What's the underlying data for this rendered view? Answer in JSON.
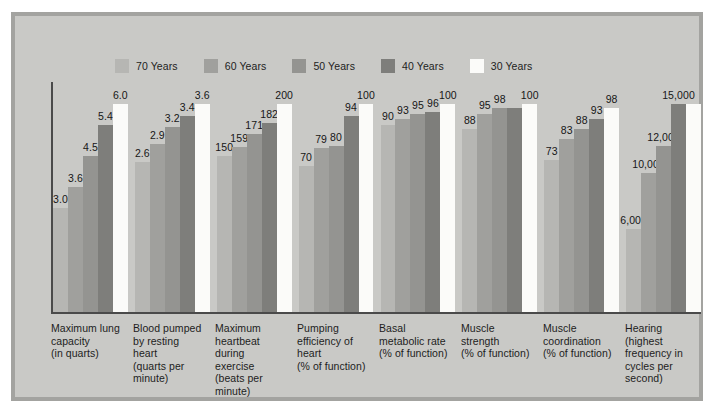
{
  "figure": {
    "background_color": "#c9c9c6",
    "frame_border_color": "#a3a3a0"
  },
  "legend": {
    "position": "top-center",
    "items": [
      {
        "label": "70 Years",
        "color": "#b6b6b3"
      },
      {
        "label": "60 Years",
        "color": "#a0a09d"
      },
      {
        "label": "50 Years",
        "color": "#949491"
      },
      {
        "label": "40 Years",
        "color": "#7e7e7b"
      },
      {
        "label": "30 Years",
        "color": "#fbfbf9"
      }
    ]
  },
  "chart_data": {
    "type": "bar",
    "title": "",
    "subtitle": "",
    "xlabel": "",
    "ylabel": "",
    "grid": false,
    "legend_position": "top-center",
    "note": "Grouped bar chart; each group is normalized to its own scale with the 30 Years bar at 100%.",
    "categories": [
      "Maximum lung capacity (in quarts)",
      "Blood pumped by resting heart (quarts per minute)",
      "Maximum heartbeat during exercise (beats per minute)",
      "Pumping efficiency of heart (% of function)",
      "Basal metabolic rate (% of function)",
      "Muscle strength (% of function)",
      "Muscle coordination (% of function)",
      "Hearing (highest frequency in cycles per second)"
    ],
    "category_lines": [
      [
        "Maximum lung",
        "capacity",
        "(in quarts)"
      ],
      [
        "Blood pumped",
        "by resting",
        "heart",
        "(quarts per",
        "minute)"
      ],
      [
        "Maximum",
        "heartbeat",
        "during",
        "exercise",
        "(beats per",
        "minute)"
      ],
      [
        "Pumping",
        "efficiency of",
        "heart",
        "(% of function)"
      ],
      [
        "Basal",
        "metabolic rate",
        "(% of function)"
      ],
      [
        "Muscle",
        "strength",
        "(% of function)"
      ],
      [
        "Muscle",
        "coordination",
        "(% of function)"
      ],
      [
        "Hearing",
        "(highest",
        "frequency in",
        "cycles per",
        "second)"
      ]
    ],
    "series": [
      {
        "name": "70 Years",
        "color": "#b6b6b3",
        "values": [
          3.0,
          2.6,
          150,
          70,
          90,
          88,
          73,
          6000
        ]
      },
      {
        "name": "60 Years",
        "color": "#a0a09d",
        "values": [
          3.6,
          2.9,
          159,
          79,
          93,
          95,
          83,
          10000
        ]
      },
      {
        "name": "50 Years",
        "color": "#949491",
        "values": [
          4.5,
          3.2,
          171,
          80,
          95,
          98,
          88,
          12000
        ]
      },
      {
        "name": "40 Years",
        "color": "#7e7e7b",
        "values": [
          5.4,
          3.4,
          182,
          94,
          96,
          98,
          93,
          15000
        ]
      },
      {
        "name": "30 Years",
        "color": "#fbfbf9",
        "values": [
          6.0,
          3.6,
          200,
          100,
          100,
          100,
          98,
          15000
        ]
      }
    ],
    "value_labels": [
      [
        "3.0",
        "3.6",
        "4.5",
        "5.4",
        "6.0"
      ],
      [
        "2.6",
        "2.9",
        "3.2",
        "3.4",
        "3.6"
      ],
      [
        "150",
        "159",
        "171",
        "182",
        "200"
      ],
      [
        "70",
        "79",
        "80",
        "94",
        "100"
      ],
      [
        "90",
        "93",
        "95",
        "96",
        "100"
      ],
      [
        "88",
        "95",
        "98",
        "",
        "100"
      ],
      [
        "73",
        "83",
        "88",
        "93",
        "98"
      ],
      [
        "6,000",
        "10,000",
        "12,000",
        "15,000",
        ""
      ]
    ],
    "group_maxima": [
      6.0,
      3.6,
      200,
      100,
      100,
      100,
      100,
      15000
    ],
    "group_baselines": [
      0,
      0,
      0,
      0,
      0,
      0,
      0,
      0
    ]
  }
}
